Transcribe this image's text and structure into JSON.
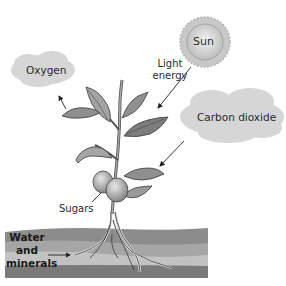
{
  "labels": {
    "sun": "Sun",
    "light_energy_line1": "Light",
    "light_energy_line2": "energy",
    "oxygen": "Oxygen",
    "carbon_dioxide": "Carbon dioxide",
    "sugars": "Sugars",
    "water_line1": "Water",
    "water_line2": "and",
    "water_line3": "minerals"
  },
  "colors": {
    "cloud": "#d6d6d6",
    "sun_core": "#cfcfcf",
    "sun_rays": "#bdbdbd",
    "leaf": "#9a9a9a",
    "leaf_dark": "#6e6e6e",
    "fruit": "#a8a8a8",
    "soil_top": "#8a8a8a",
    "soil_mid": "#a9a9a9",
    "soil_light": "#c4c4c4",
    "soil_bottom": "#7a7a7a",
    "root": "#d9d9d9"
  }
}
